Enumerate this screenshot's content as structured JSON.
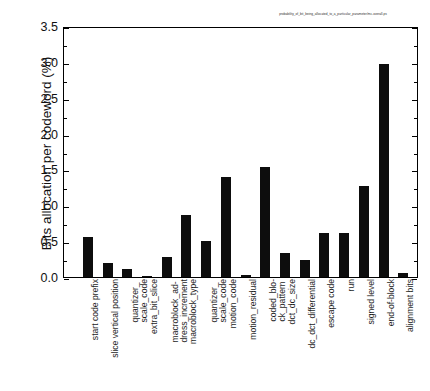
{
  "chart_data": {
    "type": "bar",
    "title": "probability_of_bit_being_allocated_to_a_particular_parameter/mc-overall.ps",
    "xlabel": "",
    "ylabel": "Bits allocation per codeword (%)",
    "ylim": [
      0.0,
      3.5
    ],
    "yticks": [
      "0.0",
      "0.5",
      "1.0",
      "1.5",
      "2.0",
      "2.5",
      "3.0",
      "3.5"
    ],
    "ytick_values": [
      0.0,
      0.5,
      1.0,
      1.5,
      2.0,
      2.5,
      3.0,
      3.5
    ],
    "grid": false,
    "legend": null,
    "bar_color": "#0d0d0d",
    "categories": [
      "start code prefix",
      "slice vertical position",
      "quantizer_scale_code",
      "extra_bit_slice",
      "macroblock_address_increment",
      "macroblock_type",
      "quantizer_scale_code",
      "motion_code",
      "motion_residual",
      "coded_block_pattern",
      "dct_dc_size",
      "dc_dct_differential",
      "escape code",
      "run",
      "signed level",
      "end-of-block",
      "alignment bits"
    ],
    "category_labels_wrapped": [
      [
        "start code prefix"
      ],
      [
        "slice vertical position"
      ],
      [
        "quantizer_",
        "scale_code"
      ],
      [
        "extra_bit_slice"
      ],
      [
        "macroblock_ad-",
        "dress_increment"
      ],
      [
        "macroblock_type"
      ],
      [
        "quantizer_",
        "scale_code"
      ],
      [
        "motion_code"
      ],
      [
        "motion_residual"
      ],
      [
        "coded_blo-",
        "ck_pattern"
      ],
      [
        "dct_dc_size"
      ],
      [
        "dc_dct_differential"
      ],
      [
        "escape code"
      ],
      [
        "run"
      ],
      [
        "signed level"
      ],
      [
        "end-of-block"
      ],
      [
        "alignment bits"
      ]
    ],
    "values": [
      0.56,
      0.19,
      0.11,
      0.02,
      0.28,
      0.86,
      0.5,
      1.4,
      0.03,
      1.53,
      0.33,
      0.24,
      0.61,
      0.61,
      1.27,
      2.97,
      0.06
    ],
    "units": "%"
  }
}
